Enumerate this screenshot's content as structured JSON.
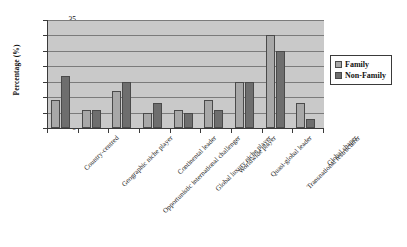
{
  "chart_data": {
    "type": "bar",
    "title": "",
    "xlabel": "",
    "ylabel": "Percentage (%)",
    "ylim": [
      0,
      35
    ],
    "ytick_step": 5,
    "yticks": [
      35,
      30,
      25,
      20,
      15,
      10,
      5,
      0
    ],
    "grid": true,
    "legend_position": "right",
    "categories": [
      "Country-centred",
      "Geographic niche player",
      "Opportunistic international challenger",
      "Continental leader",
      "Global luxury niche player",
      "Worldwide player",
      "Quasi-global leader",
      "Transnational restructurer",
      "Global shaper"
    ],
    "series": [
      {
        "name": "Family",
        "color": "#a8a8a8",
        "values": [
          9,
          6,
          12,
          5,
          6,
          9,
          15,
          30,
          8
        ]
      },
      {
        "name": "Non-Family",
        "color": "#6e6e6e",
        "values": [
          17,
          6,
          15,
          8,
          5,
          6,
          15,
          25,
          3
        ]
      }
    ]
  },
  "legend": {
    "items": [
      {
        "label": "Family",
        "swatch": "family-swatch-icon"
      },
      {
        "label": "Non-Family",
        "swatch": "non-family-swatch-icon"
      }
    ]
  }
}
